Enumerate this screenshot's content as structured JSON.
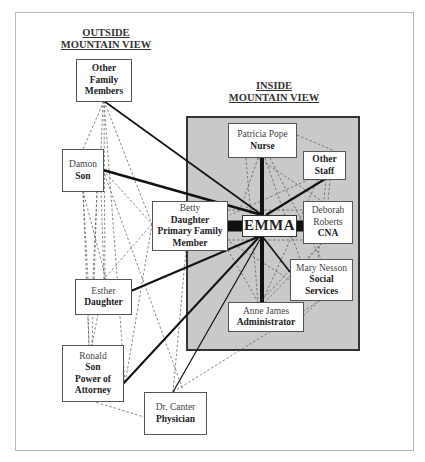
{
  "titles": {
    "outside": [
      "OUTSIDE",
      "MOUNTAIN VIEW"
    ],
    "inside": [
      "INSIDE",
      "MOUNTAIN VIEW"
    ]
  },
  "center": {
    "label": "EMMA"
  },
  "nodes": {
    "other_family": {
      "name": "",
      "role": [
        "Other",
        "Family",
        "Members"
      ]
    },
    "damon": {
      "name": "Damon",
      "role": [
        "Son"
      ]
    },
    "betty": {
      "name": "Betty",
      "role": [
        "Daughter",
        "Primary Family",
        "Member"
      ]
    },
    "esther": {
      "name": "Esther",
      "role": [
        "Daughter"
      ]
    },
    "ronald": {
      "name": "Ronald",
      "role": [
        "Son",
        "Power of",
        "Attorney"
      ]
    },
    "canter": {
      "name": "Dr. Canter",
      "role": [
        "Physician"
      ]
    },
    "patricia": {
      "name": "Patricia Pope",
      "role": [
        "Nurse"
      ]
    },
    "other_staff": {
      "name": "",
      "role": [
        "Other",
        "Staff"
      ]
    },
    "deborah": {
      "name": "Deborah Roberts",
      "role": [
        "CNA"
      ]
    },
    "mary": {
      "name": "Mary Nesson",
      "role": [
        "Social",
        "Services"
      ]
    },
    "anne": {
      "name": "Anne James",
      "role": [
        "Administrator"
      ]
    }
  },
  "colors": {
    "inside_region": "#c9c9c9",
    "strong_tie": "#111111",
    "weak_tie": "#555555"
  }
}
